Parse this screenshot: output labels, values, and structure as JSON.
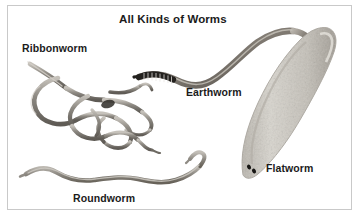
{
  "figure": {
    "title": "All Kinds of Worms",
    "background_color": "#ffffff",
    "border_color": "#c9c9c9",
    "text_color": "#1b1b1b"
  },
  "labels": {
    "ribbonworm": "Ribbonworm",
    "earthworm": "Earthworm",
    "flatworm": "Flatworm",
    "roundworm": "Roundworm"
  },
  "specimens": [
    {
      "name": "ribbonworm",
      "label": "Ribbonworm",
      "description": "long tangled knotted ribbon-like worm in coiled loops",
      "color": "#8d8a84",
      "position": "upper-left"
    },
    {
      "name": "earthworm",
      "label": "Earthworm",
      "description": "segmented S-curved worm with dark striped head band",
      "color": "#7a746c",
      "position": "upper-center-right"
    },
    {
      "name": "flatworm",
      "label": "Flatworm",
      "description": "broad pale mottled planarian with two dark eyespots",
      "color": "#cdc9c2",
      "position": "right"
    },
    {
      "name": "roundworm",
      "label": "Roundworm",
      "description": "long slender wavy nematode tapering at both ends",
      "color": "#8f8b84",
      "position": "bottom-left"
    }
  ]
}
